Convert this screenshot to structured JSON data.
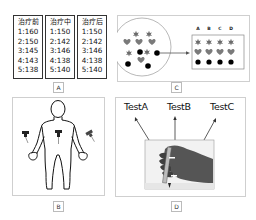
{
  "panels": {
    "A": {
      "label": "A",
      "columns": [
        {
          "header": "治疗前",
          "rows": [
            "1:160",
            "2:150",
            "3:145",
            "4:143",
            "5:138"
          ]
        },
        {
          "header": "治疗中",
          "rows": [
            "1:150",
            "2:142",
            "3:146",
            "4:138",
            "5:140"
          ]
        },
        {
          "header": "治疗后",
          "rows": [
            "1:150",
            "2:142",
            "3:146",
            "4:138",
            "5:140"
          ]
        }
      ]
    },
    "B": {
      "label": "B",
      "description": "Human body outline with three push-pins (left hand, abdomen, right hand)"
    },
    "C": {
      "label": "C",
      "columns": [
        "A",
        "B",
        "C",
        "D"
      ],
      "shapes": [
        "star",
        "heart",
        "dot"
      ],
      "description": "Mixed stars, hearts and dots in a circle sorted into columns A-D"
    },
    "D": {
      "label": "D",
      "tests": [
        "TestA",
        "TestB",
        "TestC"
      ],
      "description": "Photo of a hand holding a test tube, arrows pointing to three tests"
    }
  },
  "colors": {
    "border": "#cfcfcf",
    "ink": "#111111",
    "shape_gray": "#6b6b6b"
  }
}
